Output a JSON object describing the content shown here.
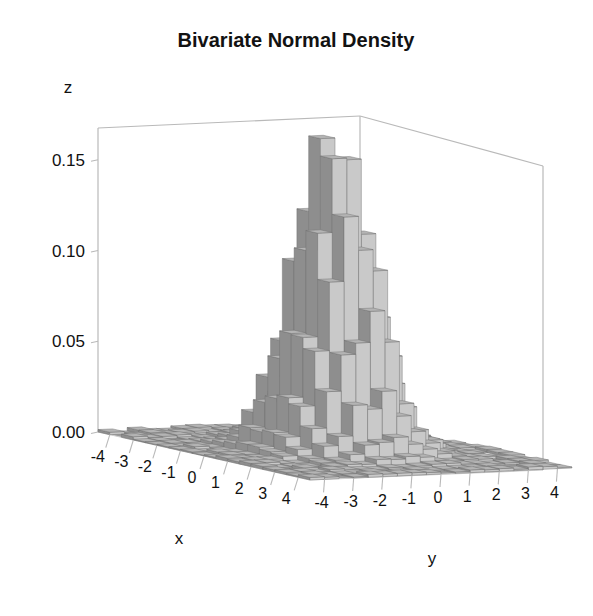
{
  "page": {
    "clipped_text_top": "a scanned figure header line partially cut off",
    "background_color": "#ffffff"
  },
  "chart_data": {
    "type": "bar",
    "subtype": "3d-bivariate-histogram",
    "title": "Bivariate Normal Density",
    "xlabel": "x",
    "ylabel": "y",
    "zlabel": "z",
    "xticks": [
      -4,
      -3,
      -2,
      -1,
      0,
      1,
      2,
      3,
      4
    ],
    "xtick_labels": [
      "-4",
      "-3",
      "-2",
      "-1",
      "0",
      "1",
      "2",
      "3",
      "4"
    ],
    "yticks": [
      -4,
      -3,
      -2,
      -1,
      0,
      1,
      2,
      3,
      4
    ],
    "ytick_labels": [
      "-4",
      "-3",
      "-2",
      "-1",
      "0",
      "1",
      "2",
      "3",
      "4"
    ],
    "zticks": [
      0.0,
      0.05,
      0.1,
      0.15
    ],
    "ztick_labels": [
      "0.00",
      "0.05",
      "0.10",
      "0.15"
    ],
    "xlim": [
      -4.5,
      4.5
    ],
    "ylim": [
      -4.5,
      4.5
    ],
    "zlim": [
      0.0,
      0.168
    ],
    "grid": false,
    "legend": false,
    "nbins_x": 18,
    "nbins_y": 18,
    "peak_value": 0.159,
    "peak_at": [
      0.0,
      0.0
    ],
    "distribution": "standard bivariate normal, rho = 0",
    "noise_seed": 1729,
    "noise_amplitude": 0.16,
    "colors": {
      "bar_top": "#b4b4b4",
      "bar_left": "#8e8e8e",
      "bar_right": "#c9c9c9",
      "bar_edge": "#6f6f6f",
      "floor": "#9a9a9a",
      "floor_edge": "#cfcfcf",
      "axis_line": "#b9b9b9",
      "text": "#111111",
      "title": "#121212"
    },
    "projection": {
      "origin_x": 98,
      "origin_y": 432,
      "front_x": 310,
      "front_y": 480,
      "right_x": 543,
      "right_y": 470,
      "back_x": 360,
      "back_y": 420,
      "z_top_y": 128,
      "box_right_top_y": 155
    }
  }
}
